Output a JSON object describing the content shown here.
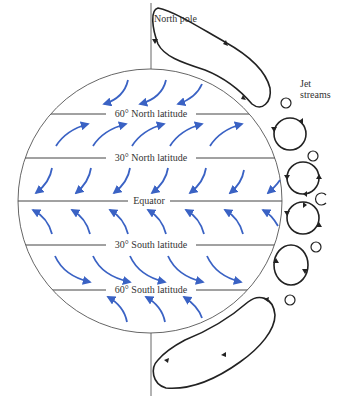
{
  "labels": {
    "north_pole": "North pole",
    "jet_streams_line1": "Jet",
    "jet_streams_line2": "streams",
    "lat_60n": "60° North latitude",
    "lat_30n": "30° North latitude",
    "equator": "Equator",
    "lat_30s": "30° South latitude",
    "lat_60s": "60° South latitude"
  },
  "colors": {
    "wind_arrow": "#3a62c4",
    "outline": "#555555",
    "cell": "#222222",
    "text": "#333333"
  }
}
